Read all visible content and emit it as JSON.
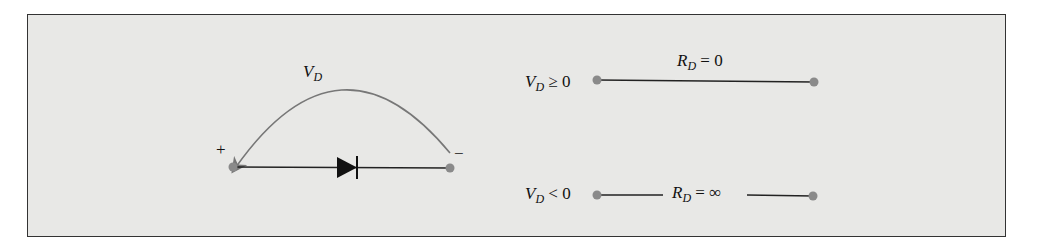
{
  "diagram": {
    "left": {
      "voltage_label": "V",
      "voltage_sub": "D",
      "plus": "+",
      "minus": "−"
    },
    "forward": {
      "condition_var": "V",
      "condition_sub": "D",
      "condition_rest": " ≥ 0",
      "res_var": "R",
      "res_sub": "D",
      "res_rest": " = 0"
    },
    "reverse": {
      "condition_var": "V",
      "condition_sub": "D",
      "condition_rest": " < 0",
      "res_var": "R",
      "res_sub": "D",
      "res_rest": " = ∞"
    },
    "colors": {
      "background": "#e8e8e6",
      "wire": "#222222",
      "node": "#8a8a8a",
      "arrow": "#777777"
    }
  }
}
